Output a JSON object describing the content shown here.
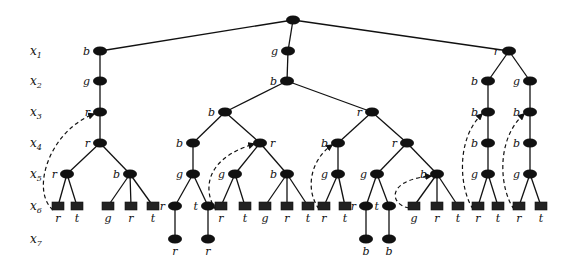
{
  "diagram": {
    "title": "",
    "row_labels": [
      {
        "var": "x",
        "sub": "1",
        "y": 51
      },
      {
        "var": "x",
        "sub": "2",
        "y": 81
      },
      {
        "var": "x",
        "sub": "3",
        "y": 112
      },
      {
        "var": "x",
        "sub": "4",
        "y": 143
      },
      {
        "var": "x",
        "sub": "5",
        "y": 174
      },
      {
        "var": "x",
        "sub": "6",
        "y": 206
      },
      {
        "var": "x",
        "sub": "7",
        "y": 239
      }
    ],
    "nodes": [
      {
        "id": "root",
        "x": 293,
        "y": 20,
        "label": "",
        "kind": "oval"
      },
      {
        "id": "L1",
        "x": 100,
        "y": 51,
        "label": "b",
        "kind": "oval",
        "parent": "root",
        "lpos": "left"
      },
      {
        "id": "L2",
        "x": 100,
        "y": 81,
        "label": "g",
        "kind": "oval",
        "parent": "L1",
        "lpos": "left"
      },
      {
        "id": "L3",
        "x": 100,
        "y": 112,
        "label": "r",
        "kind": "oval",
        "parent": "L2",
        "lpos": "left"
      },
      {
        "id": "L4",
        "x": 100,
        "y": 143,
        "label": "r",
        "kind": "oval",
        "parent": "L3",
        "lpos": "left"
      },
      {
        "id": "L5a",
        "x": 67,
        "y": 174,
        "label": "r",
        "kind": "oval",
        "parent": "L4",
        "lpos": "left"
      },
      {
        "id": "L5b",
        "x": 130,
        "y": 174,
        "label": "b",
        "kind": "oval",
        "parent": "L4",
        "lpos": "left"
      },
      {
        "id": "L6a",
        "x": 58,
        "y": 206,
        "label": "r",
        "kind": "box",
        "parent": "L5a",
        "lpos": "below"
      },
      {
        "id": "L6b",
        "x": 77,
        "y": 206,
        "label": "t",
        "kind": "box",
        "parent": "L5a",
        "lpos": "below"
      },
      {
        "id": "L6c",
        "x": 108,
        "y": 206,
        "label": "g",
        "kind": "box",
        "parent": "L5b",
        "lpos": "below"
      },
      {
        "id": "L6d",
        "x": 131,
        "y": 206,
        "label": "r",
        "kind": "box",
        "parent": "L5b",
        "lpos": "below"
      },
      {
        "id": "L6e",
        "x": 153,
        "y": 206,
        "label": "t",
        "kind": "box",
        "parent": "L5b",
        "lpos": "below"
      },
      {
        "id": "M1",
        "x": 288,
        "y": 51,
        "label": "g",
        "kind": "oval",
        "parent": "root",
        "lpos": "left"
      },
      {
        "id": "M2",
        "x": 287,
        "y": 81,
        "label": "b",
        "kind": "oval",
        "parent": "M1",
        "lpos": "left"
      },
      {
        "id": "M3a",
        "x": 225,
        "y": 112,
        "label": "b",
        "kind": "oval",
        "parent": "M2",
        "lpos": "left"
      },
      {
        "id": "M4a",
        "x": 193,
        "y": 143,
        "label": "b",
        "kind": "oval",
        "parent": "M3a",
        "lpos": "left"
      },
      {
        "id": "M5a",
        "x": 193,
        "y": 174,
        "label": "g",
        "kind": "oval",
        "parent": "M4a",
        "lpos": "left"
      },
      {
        "id": "M6a",
        "x": 175,
        "y": 206,
        "label": "r",
        "kind": "oval",
        "parent": "M5a",
        "lpos": "left"
      },
      {
        "id": "M6b",
        "x": 208,
        "y": 206,
        "label": "t",
        "kind": "oval",
        "parent": "M5a",
        "lpos": "left"
      },
      {
        "id": "M7a",
        "x": 175,
        "y": 239,
        "label": "r",
        "kind": "oval",
        "parent": "M6a",
        "lpos": "below"
      },
      {
        "id": "M7b",
        "x": 208,
        "y": 239,
        "label": "r",
        "kind": "oval",
        "parent": "M6b",
        "lpos": "below"
      },
      {
        "id": "M4b",
        "x": 260,
        "y": 143,
        "label": "r",
        "kind": "oval",
        "parent": "M3a",
        "lpos": "right"
      },
      {
        "id": "M5b",
        "x": 235,
        "y": 174,
        "label": "g",
        "kind": "oval",
        "parent": "M4b",
        "lpos": "left"
      },
      {
        "id": "M5c",
        "x": 287,
        "y": 174,
        "label": "b",
        "kind": "oval",
        "parent": "M4b",
        "lpos": "left"
      },
      {
        "id": "M6c",
        "x": 221,
        "y": 206,
        "label": "r",
        "kind": "box",
        "parent": "M5b",
        "lpos": "below"
      },
      {
        "id": "M6d",
        "x": 245,
        "y": 206,
        "label": "t",
        "kind": "box",
        "parent": "M5b",
        "lpos": "below"
      },
      {
        "id": "M6e",
        "x": 265,
        "y": 206,
        "label": "g",
        "kind": "box",
        "parent": "M5c",
        "lpos": "below"
      },
      {
        "id": "M6f",
        "x": 287,
        "y": 206,
        "label": "r",
        "kind": "box",
        "parent": "M5c",
        "lpos": "below"
      },
      {
        "id": "M6g",
        "x": 308,
        "y": 206,
        "label": "t",
        "kind": "box",
        "parent": "M5c",
        "lpos": "below"
      },
      {
        "id": "N3",
        "x": 372,
        "y": 112,
        "label": "r",
        "kind": "oval",
        "parent": "M2",
        "lpos": "left"
      },
      {
        "id": "N4a",
        "x": 338,
        "y": 143,
        "label": "b",
        "kind": "oval",
        "parent": "N3",
        "lpos": "left"
      },
      {
        "id": "N5a",
        "x": 338,
        "y": 174,
        "label": "g",
        "kind": "oval",
        "parent": "N4a",
        "lpos": "left"
      },
      {
        "id": "N6a",
        "x": 324,
        "y": 206,
        "label": "r",
        "kind": "box",
        "parent": "N5a",
        "lpos": "below"
      },
      {
        "id": "N6b",
        "x": 345,
        "y": 206,
        "label": "t",
        "kind": "box",
        "parent": "N5a",
        "lpos": "below"
      },
      {
        "id": "N4b",
        "x": 407,
        "y": 143,
        "label": "r",
        "kind": "oval",
        "parent": "N3",
        "lpos": "left"
      },
      {
        "id": "N5b",
        "x": 377,
        "y": 174,
        "label": "g",
        "kind": "oval",
        "parent": "N4b",
        "lpos": "left"
      },
      {
        "id": "N6c",
        "x": 366,
        "y": 206,
        "label": "r",
        "kind": "oval",
        "parent": "N5b",
        "lpos": "left"
      },
      {
        "id": "N6d",
        "x": 389,
        "y": 206,
        "label": "t",
        "kind": "oval",
        "parent": "N5b",
        "lpos": "left"
      },
      {
        "id": "N7a",
        "x": 366,
        "y": 239,
        "label": "b",
        "kind": "oval",
        "parent": "N6c",
        "lpos": "below"
      },
      {
        "id": "N7b",
        "x": 389,
        "y": 239,
        "label": "b",
        "kind": "oval",
        "parent": "N6d",
        "lpos": "below"
      },
      {
        "id": "N5c",
        "x": 437,
        "y": 174,
        "label": "b",
        "kind": "oval",
        "parent": "N4b",
        "lpos": "left"
      },
      {
        "id": "N6e",
        "x": 414,
        "y": 206,
        "label": "g",
        "kind": "box",
        "parent": "N5c",
        "lpos": "below"
      },
      {
        "id": "N6f",
        "x": 437,
        "y": 206,
        "label": "r",
        "kind": "box",
        "parent": "N5c",
        "lpos": "below"
      },
      {
        "id": "N6g",
        "x": 458,
        "y": 206,
        "label": "t",
        "kind": "box",
        "parent": "N5c",
        "lpos": "below"
      },
      {
        "id": "R1",
        "x": 509,
        "y": 51,
        "label": "r",
        "kind": "oval",
        "parent": "root",
        "lpos": "left"
      },
      {
        "id": "R2a",
        "x": 488,
        "y": 81,
        "label": "b",
        "kind": "oval",
        "parent": "R1",
        "lpos": "left"
      },
      {
        "id": "R3a",
        "x": 488,
        "y": 112,
        "label": "b",
        "kind": "oval",
        "parent": "R2a",
        "lpos": "left"
      },
      {
        "id": "R4a",
        "x": 488,
        "y": 143,
        "label": "b",
        "kind": "oval",
        "parent": "R3a",
        "lpos": "left"
      },
      {
        "id": "R5a",
        "x": 488,
        "y": 174,
        "label": "g",
        "kind": "oval",
        "parent": "R4a",
        "lpos": "left"
      },
      {
        "id": "R6a",
        "x": 478,
        "y": 206,
        "label": "r",
        "kind": "box",
        "parent": "R5a",
        "lpos": "below"
      },
      {
        "id": "R6b",
        "x": 498,
        "y": 206,
        "label": "t",
        "kind": "box",
        "parent": "R5a",
        "lpos": "below"
      },
      {
        "id": "R2b",
        "x": 530,
        "y": 81,
        "label": "g",
        "kind": "oval",
        "parent": "R1",
        "lpos": "left"
      },
      {
        "id": "R3b",
        "x": 530,
        "y": 112,
        "label": "b",
        "kind": "oval",
        "parent": "R2b",
        "lpos": "left"
      },
      {
        "id": "R4b",
        "x": 530,
        "y": 143,
        "label": "b",
        "kind": "oval",
        "parent": "R3b",
        "lpos": "left"
      },
      {
        "id": "R5b",
        "x": 530,
        "y": 174,
        "label": "g",
        "kind": "oval",
        "parent": "R4b",
        "lpos": "left"
      },
      {
        "id": "R6c",
        "x": 519,
        "y": 206,
        "label": "r",
        "kind": "box",
        "parent": "R5b",
        "lpos": "below"
      },
      {
        "id": "R6d",
        "x": 541,
        "y": 206,
        "label": "t",
        "kind": "box",
        "parent": "R5b",
        "lpos": "below"
      }
    ],
    "backjumps": [
      {
        "from": "L6a",
        "to": "L3",
        "path": "M 53 210 C 30 190, 50 130, 94 114"
      },
      {
        "from": "M6c",
        "to": "M4b",
        "path": "M 216 210 C 205 195, 200 160, 254 144"
      },
      {
        "from": "N6a",
        "to": "N4a",
        "path": "M 319 209 C 305 190, 310 160, 332 145"
      },
      {
        "from": "N6e",
        "to": "N5c",
        "path": "M 409 208 C 390 205, 385 180, 431 176"
      },
      {
        "from": "R6a",
        "to": "R3a",
        "path": "M 473 209 C 460 190, 455 140, 482 114"
      },
      {
        "from": "R6c",
        "to": "R3b",
        "path": "M 514 209 C 500 190, 495 140, 524 114"
      }
    ]
  }
}
